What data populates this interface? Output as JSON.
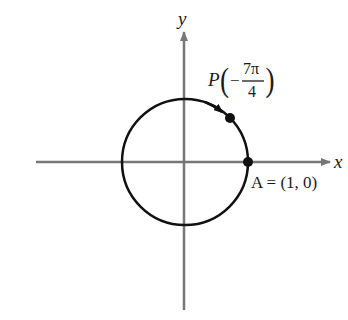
{
  "diagram": {
    "axes": {
      "x_label": "x",
      "y_label": "y"
    },
    "points": {
      "P": {
        "name": "P",
        "numerator": "7π",
        "denominator": "4",
        "sign": "−"
      },
      "A": {
        "label": "A = (1, 0)"
      }
    },
    "colors": {
      "axis": "#777777",
      "circle": "#111111",
      "text": "#1a1a1a"
    }
  }
}
